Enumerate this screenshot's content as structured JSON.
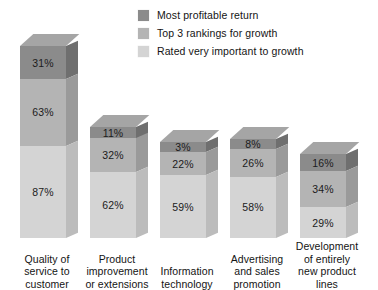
{
  "chart_data": {
    "type": "bar",
    "subtype": "stacked-3d-column",
    "title": "",
    "subtitle": "",
    "xlabel": "",
    "ylabel": "",
    "grid": false,
    "legend_position": "top-right",
    "value_suffix": "%",
    "ylim": [
      0,
      100
    ],
    "categories": [
      "Quality of service to customer",
      "Product improvement or extensions",
      "Information technology",
      "Advertising and sales promotion",
      "Development of entirely new product lines"
    ],
    "category_lines": [
      [
        "Quality of",
        "service to",
        "customer"
      ],
      [
        "Product",
        "improvement",
        "or extensions"
      ],
      [
        "Information",
        "technology"
      ],
      [
        "Advertising",
        "and sales",
        "promotion"
      ],
      [
        "Development",
        "of entirely",
        "new product",
        "lines"
      ]
    ],
    "series": [
      {
        "name": "Most profitable return",
        "color": "#8b8b8b",
        "values": [
          31,
          11,
          3,
          8,
          16
        ],
        "labels": [
          "31%",
          "11%",
          "3%",
          "8%",
          "16%"
        ]
      },
      {
        "name": "Top 3 rankings for growth",
        "color": "#b4b4b4",
        "values": [
          63,
          32,
          22,
          26,
          34
        ],
        "labels": [
          "63%",
          "32%",
          "22%",
          "26%",
          "34%"
        ]
      },
      {
        "name": "Rated very important to growth",
        "color": "#d4d4d4",
        "values": [
          87,
          62,
          59,
          58,
          29
        ],
        "labels": [
          "87%",
          "62%",
          "59%",
          "58%",
          "29%"
        ]
      }
    ]
  },
  "legend": {
    "items": [
      {
        "label": "Most profitable return",
        "color": "#8b8b8b"
      },
      {
        "label": "Top 3 rankings for growth",
        "color": "#b4b4b4"
      },
      {
        "label": "Rated very important to growth",
        "color": "#d4d4d4"
      }
    ]
  },
  "colors": {
    "background": "#ffffff",
    "text": "#141414",
    "series_dark": "#8b8b8b",
    "series_mid": "#b4b4b4",
    "series_light": "#d4d4d4",
    "top_face_dark": "#a5a5a5",
    "top_face_mid": "#c8c8c8",
    "top_face_light": "#e2e2e2",
    "side_face_dark": "#6f6f6f",
    "side_face_mid": "#9a9a9a",
    "side_face_light": "#bcbcbc"
  }
}
